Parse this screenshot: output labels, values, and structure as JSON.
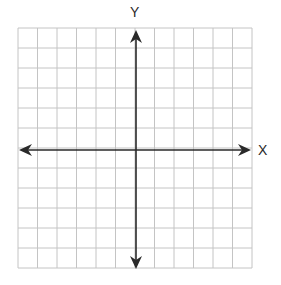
{
  "diagram": {
    "type": "coordinate-plane",
    "x_axis_label": "X",
    "y_axis_label": "Y",
    "grid": {
      "columns": 12,
      "rows": 12,
      "left": 18,
      "top": 28,
      "right": 252,
      "bottom": 268,
      "line_color": "#c4c4c4"
    },
    "axes": {
      "origin_x": 136,
      "origin_y": 150,
      "color": "#2a2a2a",
      "arrows": [
        "left",
        "right",
        "up",
        "down"
      ]
    }
  }
}
